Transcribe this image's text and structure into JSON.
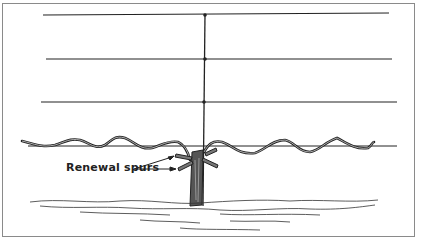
{
  "figure": {
    "label": "Renewal spurs",
    "edge_text": [
      "r",
      "s",
      "s",
      "f",
      "c",
      "c",
      "t",
      "c",
      "s",
      "f",
      "c",
      "c",
      "c",
      "",
      "",
      "",
      "",
      ""
    ]
  }
}
